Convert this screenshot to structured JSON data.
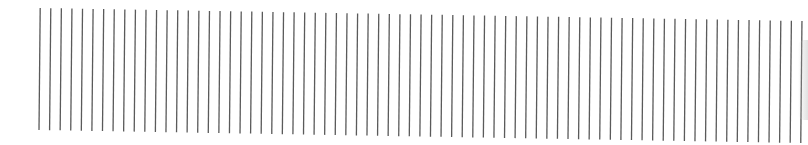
{
  "figure": {
    "line_count": 73,
    "first_x": 39,
    "spacing": 10.58,
    "top_left_y": 8,
    "top_right_y": 21,
    "bottom_left_y": 130,
    "bottom_right_y": 143,
    "slant": 1.2,
    "line_color": "#5a5a5a",
    "line_width": 1.3,
    "background": "#ffffff"
  }
}
